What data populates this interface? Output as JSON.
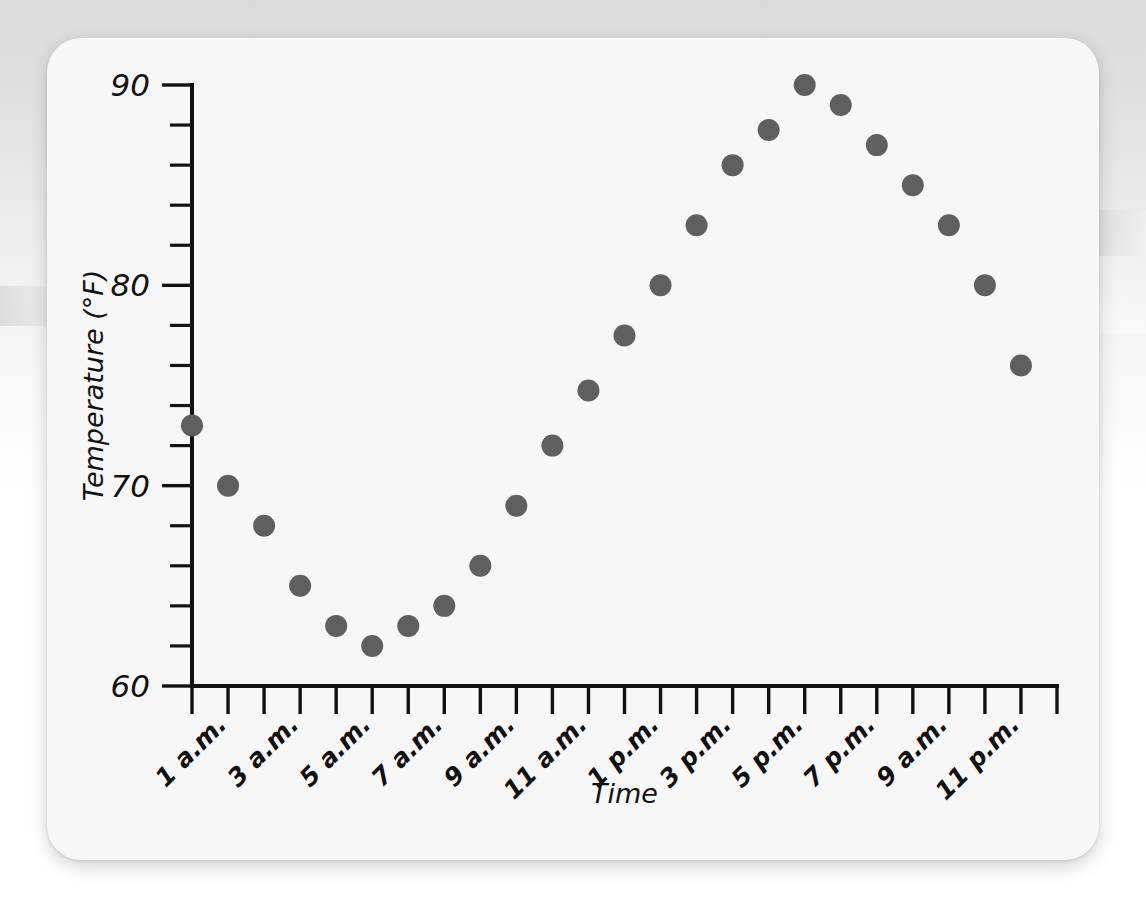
{
  "page": {
    "background_color": "#e2e2e2",
    "card_color": "#f7f7f7",
    "top_clipped_text": ""
  },
  "chart_data": {
    "type": "scatter",
    "title": "",
    "xlabel": "Time",
    "ylabel": "Temperature (°F)",
    "ylim": [
      60,
      90
    ],
    "y_major_ticks": [
      60,
      70,
      80,
      90
    ],
    "y_major_tick_labels": [
      "60",
      "70",
      "80",
      "90"
    ],
    "y_minor_tick_step": 2,
    "grid": false,
    "legend": null,
    "marker_color": "#5f5f5f",
    "marker_radius": 11,
    "x_tick_labels": [
      "1 a.m.",
      "3 a.m.",
      "5 a.m.",
      "7 a.m.",
      "9 a.m.",
      "11 a.m.",
      "1 p.m.",
      "3 p.m.",
      "5 p.m.",
      "7 p.m.",
      "9 a.m.",
      "11 p.m."
    ],
    "x_tick_label_rotation_deg": -45,
    "categories": [
      "12 a.m.",
      "1 a.m.",
      "2 a.m.",
      "3 a.m.",
      "4 a.m.",
      "5 a.m.",
      "6 a.m.",
      "7 a.m.",
      "8 a.m.",
      "9 a.m.",
      "10 a.m.",
      "11 a.m.",
      "12 p.m.",
      "1 p.m.",
      "2 p.m.",
      "3 p.m.",
      "4 p.m.",
      "5 p.m.",
      "6 p.m.",
      "7 p.m.",
      "8 p.m.",
      "9 p.m.",
      "10 p.m.",
      "11 p.m."
    ],
    "values": [
      73,
      70,
      68,
      65,
      63,
      62,
      63,
      64,
      66,
      69,
      72,
      74.75,
      77.5,
      80,
      83,
      86,
      87.75,
      90,
      89,
      87,
      85,
      83,
      80,
      77.5
    ],
    "last_point_value": 76
  }
}
